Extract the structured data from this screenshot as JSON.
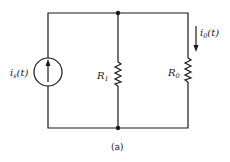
{
  "diagram": {
    "type": "circuit",
    "caption": "(a)",
    "source": {
      "symbol": "i",
      "subscript": "s",
      "arg": "(t)",
      "kind": "current-source",
      "direction": "up"
    },
    "resistor_1": {
      "symbol": "R",
      "subscript": "1"
    },
    "resistor_0": {
      "symbol": "R",
      "subscript": "0"
    },
    "output_current": {
      "symbol": "i",
      "subscript": "0",
      "arg": "(t)",
      "direction": "down"
    },
    "colors": {
      "ink": "#1a1a1a",
      "background": "#ffffff"
    }
  }
}
